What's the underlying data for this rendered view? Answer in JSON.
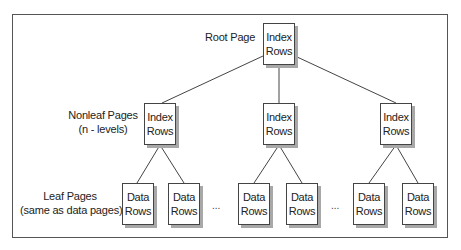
{
  "labels": {
    "root": "Root Page",
    "nonleaf_line1": "Nonleaf Pages",
    "nonleaf_line2": "(n - levels)",
    "leaf_line1": "Leaf Pages",
    "leaf_line2": "(same as data pages)"
  },
  "root": {
    "line1": "Index",
    "line2": "Rows"
  },
  "nonleaf": [
    {
      "line1": "Index",
      "line2": "Rows"
    },
    {
      "line1": "Index",
      "line2": "Rows"
    },
    {
      "line1": "Index",
      "line2": "Rows"
    }
  ],
  "leaf": [
    {
      "line1": "Data",
      "line2": "Rows"
    },
    {
      "line1": "Data",
      "line2": "Rows"
    },
    {
      "line1": "Data",
      "line2": "Rows"
    },
    {
      "line1": "Data",
      "line2": "Rows"
    },
    {
      "line1": "Data",
      "line2": "Rows"
    },
    {
      "line1": "Data",
      "line2": "Rows"
    }
  ],
  "ellipsis": "..."
}
